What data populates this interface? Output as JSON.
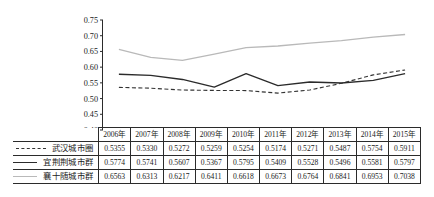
{
  "chart_data": {
    "type": "line",
    "title": "",
    "xlabel": "",
    "ylabel": "",
    "ylim": [
      0.4,
      0.75
    ],
    "ytick_step": 0.05,
    "ytick_labels": [
      "0.75",
      "0.70",
      "0.65",
      "0.60",
      "0.55",
      "0.50",
      "0.45",
      "0.40"
    ],
    "ytick_values": [
      0.75,
      0.7,
      0.65,
      0.6,
      0.55,
      0.5,
      0.45,
      0.4
    ],
    "grid": false,
    "legend_position": "table-left",
    "categories": [
      "2006年",
      "2007年",
      "2008年",
      "2009年",
      "2010年",
      "2011年",
      "2012年",
      "2013年",
      "2014年",
      "2015年"
    ],
    "series": [
      {
        "name": "武汉城市圈",
        "style": "dashed",
        "color": "#333333",
        "values": [
          0.5355,
          0.533,
          0.5272,
          0.5259,
          0.5254,
          0.5174,
          0.5271,
          0.5487,
          0.5754,
          0.5911
        ]
      },
      {
        "name": "宜荆荆城市群",
        "style": "solid",
        "color": "#2b2b2b",
        "values": [
          0.5774,
          0.5741,
          0.5607,
          0.5367,
          0.5795,
          0.5409,
          0.5528,
          0.5496,
          0.5581,
          0.5797
        ]
      },
      {
        "name": "襄十随城市群",
        "style": "solid",
        "color": "#b9b9b9",
        "values": [
          0.6563,
          0.6313,
          0.6217,
          0.6411,
          0.6618,
          0.6673,
          0.6764,
          0.6841,
          0.6953,
          0.7038
        ]
      }
    ]
  },
  "table": {
    "corner_label": "",
    "header": [
      "2006年",
      "2007年",
      "2008年",
      "2009年",
      "2010年",
      "2011年",
      "2012年",
      "2013年",
      "2014年",
      "2015年"
    ],
    "rows": [
      {
        "label": "武汉城市圈",
        "swatch": "dashed",
        "values": [
          "0.5355",
          "0.5330",
          "0.5272",
          "0.5259",
          "0.5254",
          "0.5174",
          "0.5271",
          "0.5487",
          "0.5754",
          "0.5911"
        ]
      },
      {
        "label": "宜荆荆城市群",
        "swatch": "solid-dark",
        "values": [
          "0.5774",
          "0.5741",
          "0.5607",
          "0.5367",
          "0.5795",
          "0.5409",
          "0.5528",
          "0.5496",
          "0.5581",
          "0.5797"
        ]
      },
      {
        "label": "襄十随城市群",
        "swatch": "solid-light",
        "values": [
          "0.6563",
          "0.6313",
          "0.6217",
          "0.6411",
          "0.6618",
          "0.6673",
          "0.6764",
          "0.6841",
          "0.6953",
          "0.7038"
        ]
      }
    ]
  },
  "colors": {
    "axis": "#2b2b2b",
    "grid_border": "#2b2b2b",
    "series_dashed": "#333333",
    "series_dark": "#2b2b2b",
    "series_light": "#b9b9b9",
    "background": "#ffffff"
  }
}
